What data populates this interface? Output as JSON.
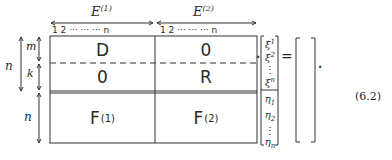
{
  "equation": {
    "number": "(6.2)",
    "top_labels": {
      "left": {
        "base": "E",
        "sup": "(1)"
      },
      "right": {
        "base": "E",
        "sup": "(2)"
      }
    },
    "column_indices": {
      "left": "1  2  ···  ···  ···  n",
      "right": "1  2  ···  ···  ···  n"
    },
    "row_labels": {
      "outer_top": "n",
      "m": "m",
      "k": "k",
      "outer_bottom": "n"
    },
    "blocks": {
      "top_left": "D",
      "top_right": "0",
      "mid_left": "0",
      "mid_right": "R",
      "bottom_left": {
        "base": "F",
        "sup": "(1)"
      },
      "bottom_right": {
        "base": "F",
        "sup": "(2)"
      }
    },
    "vector": {
      "xi": [
        "ξ",
        "ξ",
        "⋮",
        "ξ"
      ],
      "xi_sup": [
        "1",
        "2",
        "",
        "n"
      ],
      "eta": [
        "η",
        "η",
        "⋮",
        "η"
      ],
      "eta_sub": [
        "1",
        "2",
        "",
        "n"
      ]
    },
    "operators": {
      "dot": "·",
      "equals": "=",
      "end_dot": "·"
    }
  }
}
